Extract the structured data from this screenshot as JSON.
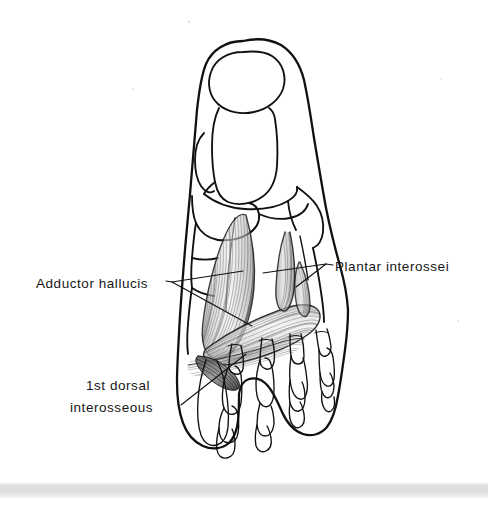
{
  "figure": {
    "kind": "anatomical-line-illustration",
    "background_color": "#ffffff",
    "ink_color": "#111111",
    "muscle_shading_color": "#9a9a9a"
  },
  "labels": [
    {
      "id": "adductor-hallucis",
      "text": "Adductor hallucis",
      "x": 36,
      "y": 283,
      "anchor": "start",
      "leader_vertex": [
        172,
        282
      ],
      "leader_targets": [
        [
          243,
          271
        ],
        [
          252,
          326
        ]
      ]
    },
    {
      "id": "plantar-interossei",
      "text": "Plantar interossei",
      "x": 335,
      "y": 267,
      "anchor": "start",
      "leader_vertex": [
        326,
        264
      ],
      "leader_targets": [
        [
          263,
          273
        ],
        [
          296,
          287
        ]
      ]
    },
    {
      "id": "first-dorsal-interosseous-line1",
      "text": "1st dorsal",
      "x": 86,
      "y": 385,
      "anchor": "start",
      "leader_vertex": null,
      "leader_targets": []
    },
    {
      "id": "first-dorsal-interosseous-line2",
      "text": "interosseous",
      "x": 70,
      "y": 407,
      "anchor": "start",
      "leader_vertex": [
        181,
        405
      ],
      "leader_targets": [
        [
          246,
          354
        ]
      ]
    }
  ],
  "structures": [
    "soft tissue outline of foot",
    "hallux distal phalanx",
    "hallux proximal phalanx",
    "first metatarsal",
    "medial cuneiform",
    "intermediate cuneiform",
    "lateral cuneiform",
    "cuboid",
    "navicular",
    "lesser metatarsals 2-5",
    "proximal, middle and distal phalanges of toes 2-5",
    "adductor hallucis oblique head",
    "adductor hallucis transverse head",
    "plantar interossei",
    "first dorsal interosseous"
  ],
  "scan_artifact": {
    "present": true,
    "description": "light grey horizontal scan band across the bottom edge of the page",
    "top": 482,
    "height": 16,
    "color": "#dcdcdc"
  }
}
